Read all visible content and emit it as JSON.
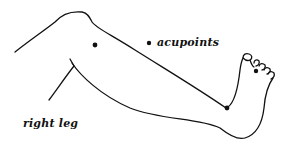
{
  "diagram": {
    "type": "anatomical-line-drawing",
    "subject": "right leg",
    "legend": {
      "marker": "filled-dot",
      "label": "acupoints"
    },
    "caption": "right leg",
    "acupoints": [
      {
        "name": "thigh-point",
        "x": 95,
        "y": 45
      },
      {
        "name": "ankle-point",
        "x": 227,
        "y": 108
      },
      {
        "name": "toe-point",
        "x": 256,
        "y": 71
      }
    ],
    "colors": {
      "line": "#111111",
      "background": "#ffffff"
    }
  }
}
